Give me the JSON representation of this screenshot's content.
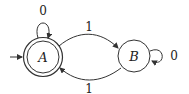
{
  "diagram": {
    "type": "finite-automaton",
    "states": [
      {
        "id": "A",
        "label": "A",
        "accepting": true,
        "initial": true
      },
      {
        "id": "B",
        "label": "B",
        "accepting": false,
        "initial": false
      }
    ],
    "transitions": [
      {
        "from": "A",
        "to": "A",
        "label": "0"
      },
      {
        "from": "A",
        "to": "B",
        "label": "1"
      },
      {
        "from": "B",
        "to": "A",
        "label": "1"
      },
      {
        "from": "B",
        "to": "B",
        "label": "0"
      }
    ]
  },
  "labels": {
    "state_a": "A",
    "state_b": "B",
    "loop_a": "0",
    "loop_b": "0",
    "edge_ab": "1",
    "edge_ba": "1"
  }
}
